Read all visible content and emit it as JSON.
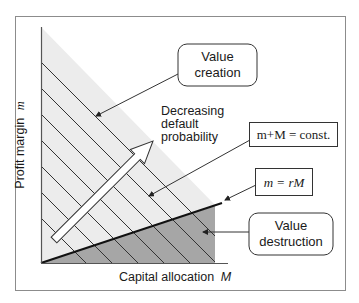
{
  "diagram": {
    "y_axis_label": "Profit margin",
    "y_axis_symbol": "m",
    "x_axis_label": "Capital allocation",
    "x_axis_symbol": "M",
    "callouts": {
      "value_creation": [
        "Value",
        "creation"
      ],
      "value_destruction": [
        "Value",
        "destruction"
      ],
      "iso_line": "m+M = const.",
      "break_even_line": "m = rM"
    },
    "arrow_label": [
      "Decreasing",
      "default",
      "probability"
    ],
    "colors": {
      "frame": "#8c8c8c",
      "light_region": "#ececec",
      "dark_region": "#a6a6a6",
      "lines": "#222222"
    }
  }
}
